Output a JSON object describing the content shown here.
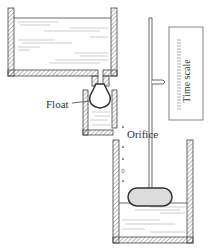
{
  "diagram": {
    "labels": {
      "float": "Float",
      "orifice": "Orifice",
      "time_scale": "Time scale"
    },
    "colors": {
      "stroke": "#444444",
      "hatch": "#777777",
      "float_fill": "#dcdcdc",
      "water_lines": "#888888"
    },
    "components": [
      "upper-reservoir",
      "feed-pipe",
      "float-chamber",
      "float-valve",
      "orifice-drips",
      "lower-vessel",
      "indicator-float",
      "indicator-rod",
      "pointer",
      "time-scale"
    ]
  }
}
